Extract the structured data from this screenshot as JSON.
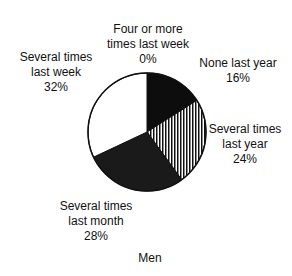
{
  "chart_data": {
    "type": "pie",
    "title": "Men",
    "start_angle": "12 o'clock, clockwise",
    "slices": [
      {
        "label": "None last year",
        "value": 16,
        "fill": "black"
      },
      {
        "label": "Several times last year",
        "value": 24,
        "fill": "vertical-stripes"
      },
      {
        "label": "Several times last month",
        "value": 28,
        "fill": "dark-stipple"
      },
      {
        "label": "Several times last week",
        "value": 32,
        "fill": "white"
      },
      {
        "label": "Four or more times last week",
        "value": 0,
        "fill": "none"
      }
    ]
  },
  "labels": {
    "four_or_more": {
      "l1": "Four or more",
      "l2": "times last week",
      "pct": "0%"
    },
    "none_last_year": {
      "l1": "None last year",
      "pct": "16%"
    },
    "several_year": {
      "l1": "Several times",
      "l2": "last year",
      "pct": "24%"
    },
    "several_month": {
      "l1": "Several times",
      "l2": "last month",
      "pct": "28%"
    },
    "several_week": {
      "l1": "Several times",
      "l2": "last week",
      "pct": "32%"
    },
    "caption": "Men"
  }
}
